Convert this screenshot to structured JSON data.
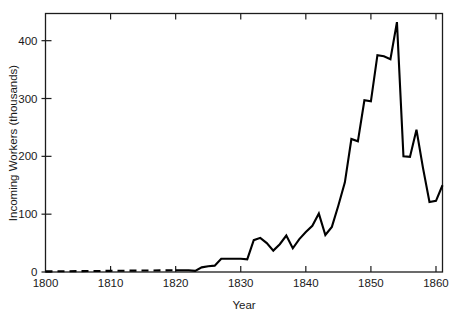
{
  "chart_data": {
    "type": "line",
    "title": "",
    "xlabel": "Year",
    "ylabel": "Incoming Workers (thousands)",
    "xlim": [
      1800,
      1861
    ],
    "ylim": [
      0,
      447
    ],
    "grid": false,
    "legend": null,
    "xticks": [
      1800,
      1810,
      1820,
      1830,
      1840,
      1850,
      1860
    ],
    "xtick_labels": [
      "1800",
      "1810",
      "1820",
      "1830",
      "1840",
      "1850",
      "1860"
    ],
    "yticks": [
      0,
      100,
      200,
      300,
      400
    ],
    "ytick_labels": [
      "0",
      "100",
      "200",
      "300",
      "400"
    ],
    "series": [
      {
        "name": "Incoming workers (estimated)",
        "style": "dashed",
        "x": [
          1800,
          1810,
          1820
        ],
        "values": [
          1,
          2,
          3
        ]
      },
      {
        "name": "Incoming workers (recorded)",
        "style": "solid",
        "x": [
          1820,
          1821,
          1822,
          1823,
          1824,
          1825,
          1826,
          1827,
          1828,
          1829,
          1830,
          1831,
          1832,
          1833,
          1834,
          1835,
          1836,
          1837,
          1838,
          1839,
          1840,
          1841,
          1842,
          1843,
          1844,
          1845,
          1846,
          1847,
          1848,
          1849,
          1850,
          1851,
          1852,
          1853,
          1854,
          1855,
          1856,
          1857,
          1858,
          1859,
          1860,
          1861
        ],
        "values": [
          3,
          3,
          3,
          2,
          8,
          10,
          11,
          23,
          23,
          23,
          23,
          22,
          55,
          59,
          50,
          37,
          48,
          63,
          41,
          57,
          69,
          80,
          101,
          64,
          78,
          115,
          155,
          230,
          226,
          297,
          295,
          375,
          373,
          368,
          432,
          200,
          199,
          246,
          180,
          121,
          123,
          150
        ]
      }
    ]
  },
  "axes": {
    "x_axis_label": "Year",
    "y_axis_label": "Incoming Workers (thousands)"
  }
}
